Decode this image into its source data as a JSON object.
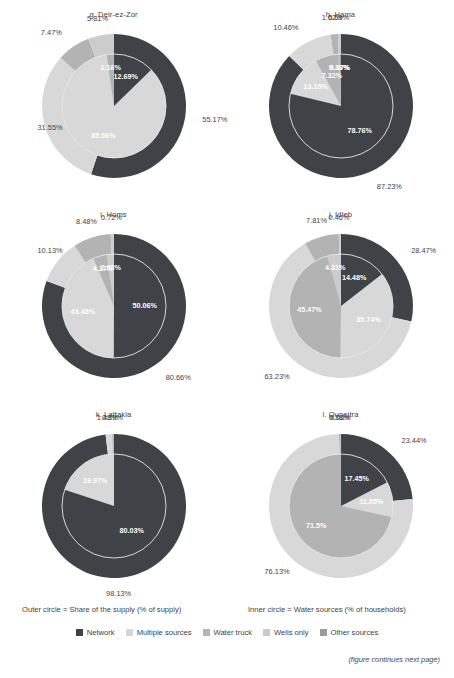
{
  "figure": {
    "outer_caption": "Outer circle = Share of the supply (% of supply)",
    "inner_caption": "Inner circle = Water sources (% of households)",
    "continues_note": "(figure continues next page)"
  },
  "legend": {
    "items": [
      {
        "label": "Network",
        "color": "#3f4347"
      },
      {
        "label": "Multiple sources",
        "color": "#d6d6d6"
      },
      {
        "label": "Water truck",
        "color": "#b5b5b5"
      },
      {
        "label": "Wells only",
        "color": "#c9c9c9"
      },
      {
        "label": "Other sources",
        "color": "#9a9a9a"
      }
    ]
  },
  "palette": {
    "network": "#3f4347",
    "multiple_sources": "#d8d8d8",
    "water_truck": "#b3b3b3",
    "wells_only": "#cccccc",
    "other_sources": "#9c9c9c",
    "ring_line": "#e8e8e8",
    "label_text": "#3f3f3f",
    "inner_label_text": "#ffffff"
  },
  "chart_data": [
    {
      "type": "pie",
      "id": "deir-ez-zor",
      "title": "g. Deir-ez-Zor",
      "outer": {
        "name": "Share of the supply (% of supply)",
        "categories": [
          "Network",
          "Multiple sources",
          "Water truck",
          "Wells only"
        ],
        "values": [
          55.17,
          31.55,
          7.47,
          5.81
        ]
      },
      "inner": {
        "name": "Water sources (% of households)",
        "categories": [
          "Network",
          "Multiple sources",
          "Water truck"
        ],
        "values": [
          12.69,
          85.06,
          2.16
        ]
      }
    },
    {
      "type": "pie",
      "id": "hama",
      "title": "h. Hama",
      "outer": {
        "name": "Share of the supply (% of supply)",
        "categories": [
          "Network",
          "Multiple sources",
          "Water truck",
          "Wells only"
        ],
        "values": [
          87.23,
          10.46,
          1.62,
          0.69
        ]
      },
      "inner": {
        "name": "Water sources (% of households)",
        "categories": [
          "Network",
          "Multiple sources",
          "Water truck",
          "Wells only",
          "Other sources"
        ],
        "values": [
          78.76,
          13.19,
          7.32,
          0.36,
          0.37
        ]
      }
    },
    {
      "type": "pie",
      "id": "homs",
      "title": "i. Homs",
      "outer": {
        "name": "Share of the supply (% of supply)",
        "categories": [
          "Network",
          "Multiple sources",
          "Water truck",
          "Wells only"
        ],
        "values": [
          80.66,
          10.13,
          8.48,
          0.72
        ]
      },
      "inner": {
        "name": "Water sources (% of households)",
        "categories": [
          "Network",
          "Multiple sources",
          "Water truck",
          "Wells only"
        ],
        "values": [
          50.06,
          43.48,
          4.17,
          2.28
        ]
      }
    },
    {
      "type": "pie",
      "id": "idleb",
      "title": "j. Idleb",
      "outer": {
        "name": "Share of the supply (% of supply)",
        "categories": [
          "Network",
          "Multiple sources",
          "Water truck",
          "Wells only"
        ],
        "values": [
          28.47,
          63.23,
          7.81,
          0.46
        ]
      },
      "inner": {
        "name": "Water sources (% of households)",
        "categories": [
          "Network",
          "Multiple sources",
          "Water truck",
          "Wells only"
        ],
        "values": [
          14.48,
          35.74,
          45.47,
          4.31
        ]
      }
    },
    {
      "type": "pie",
      "id": "lattakia",
      "title": "k. Lattakia",
      "outer": {
        "name": "Share of the supply (% of supply)",
        "categories": [
          "Network",
          "Multiple sources",
          "Water truck"
        ],
        "values": [
          98.13,
          1.48,
          0.39
        ]
      },
      "inner": {
        "name": "Water sources (% of households)",
        "categories": [
          "Network",
          "Multiple sources"
        ],
        "values": [
          80.03,
          19.97
        ]
      }
    },
    {
      "type": "pie",
      "id": "quneitra",
      "title": "l. Quneitra",
      "outer": {
        "name": "Share of the supply (% of supply)",
        "categories": [
          "Network",
          "Multiple sources",
          "Water truck",
          "Wells only"
        ],
        "values": [
          23.44,
          76.13,
          0.38,
          0.06
        ]
      },
      "inner": {
        "name": "Water sources (% of households)",
        "categories": [
          "Network",
          "Multiple sources",
          "Water truck"
        ],
        "values": [
          17.45,
          11.05,
          71.5
        ]
      }
    }
  ],
  "panels": [
    {
      "title": "g. Deir-ez-Zor",
      "outer_labels": [
        {
          "text": "55.17%",
          "pos": "right"
        },
        {
          "text": "31.55%",
          "pos": "bottom-left"
        },
        {
          "text": "7.47%",
          "pos": "top-left"
        },
        {
          "text": "5.81%",
          "pos": "top"
        }
      ],
      "inner_labels": [
        {
          "text": "12.69%"
        },
        {
          "text": "85.06%"
        },
        {
          "text": "2.16%"
        }
      ]
    },
    {
      "title": "h. Hama",
      "outer_labels": [
        {
          "text": "87.23%"
        },
        {
          "text": "10.46%"
        },
        {
          "text": "1.62%"
        },
        {
          "text": "0.69%"
        }
      ],
      "inner_labels": [
        {
          "text": "78.76%"
        },
        {
          "text": "13.19%"
        },
        {
          "text": "7.32%"
        },
        {
          "text": "0.36%"
        },
        {
          "text": "0.37%"
        }
      ]
    },
    {
      "title": "i. Homs",
      "outer_labels": [
        {
          "text": "80.66%"
        },
        {
          "text": "10.13%"
        },
        {
          "text": "8.48%"
        },
        {
          "text": "0.72%"
        }
      ],
      "inner_labels": [
        {
          "text": "50.06%"
        },
        {
          "text": "43.48%"
        },
        {
          "text": "4.17%"
        },
        {
          "text": "2.28%"
        }
      ]
    },
    {
      "title": "j. Idleb",
      "outer_labels": [
        {
          "text": "28.47%"
        },
        {
          "text": "63.23%"
        },
        {
          "text": "7.81%"
        },
        {
          "text": "0.46%"
        }
      ],
      "inner_labels": [
        {
          "text": "14.48%"
        },
        {
          "text": "35.74%"
        },
        {
          "text": "45.47%"
        },
        {
          "text": "4.31%"
        }
      ]
    },
    {
      "title": "k. Lattakia",
      "outer_labels": [
        {
          "text": "98.13%"
        },
        {
          "text": "1.48%"
        },
        {
          "text": "0.39%"
        }
      ],
      "inner_labels": [
        {
          "text": "80.03%"
        },
        {
          "text": "19.97%"
        }
      ]
    },
    {
      "title": "l. Quneitra",
      "outer_labels": [
        {
          "text": "23.44%"
        },
        {
          "text": "76.13%"
        },
        {
          "text": "0.38%"
        },
        {
          "text": "0.06%"
        }
      ],
      "inner_labels": [
        {
          "text": "17.45%"
        },
        {
          "text": "11.05%"
        },
        {
          "text": "71.5%"
        }
      ]
    }
  ]
}
